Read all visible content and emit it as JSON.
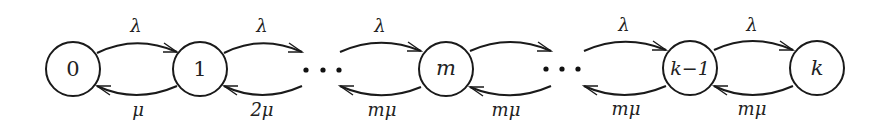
{
  "diagram": {
    "type": "birth-death chain",
    "nodes": [
      {
        "id": "0",
        "label": "0",
        "italic": false,
        "cx": 73,
        "cy": 69
      },
      {
        "id": "1",
        "label": "1",
        "italic": false,
        "cx": 200,
        "cy": 69
      },
      {
        "id": "m",
        "label": "m",
        "italic": true,
        "cx": 446,
        "cy": 69
      },
      {
        "id": "k-1",
        "label": "k−1",
        "italic": true,
        "cx": 690,
        "cy": 68
      },
      {
        "id": "k",
        "label": "k",
        "italic": true,
        "cx": 817,
        "cy": 68
      }
    ],
    "ellipses": [
      {
        "id": "ellipsis-left",
        "dots_x": [
          306,
          323,
          339
        ],
        "y": 70
      },
      {
        "id": "ellipsis-right",
        "dots_x": [
          546,
          562,
          578
        ],
        "y": 69
      }
    ],
    "edges": {
      "forward": [
        {
          "from": "0",
          "to": "1",
          "label": "λ"
        },
        {
          "from": "1",
          "to": "ellipsis-left",
          "label": "λ"
        },
        {
          "from": "ellipsis-left",
          "to": "m",
          "label": "λ"
        },
        {
          "from": "m",
          "to": "ellipsis-right",
          "label": ""
        },
        {
          "from": "ellipsis-right",
          "to": "k-1",
          "label": "λ"
        },
        {
          "from": "k-1",
          "to": "k",
          "label": "λ"
        }
      ],
      "backward": [
        {
          "from": "1",
          "to": "0",
          "label": "μ"
        },
        {
          "from": "ellipsis-left",
          "to": "1",
          "label": "2μ"
        },
        {
          "from": "m",
          "to": "ellipsis-left",
          "label": "mμ"
        },
        {
          "from": "ellipsis-right",
          "to": "m",
          "label": "mμ"
        },
        {
          "from": "k-1",
          "to": "ellipsis-right",
          "label": "mμ"
        },
        {
          "from": "k",
          "to": "k-1",
          "label": "mμ"
        }
      ]
    }
  }
}
